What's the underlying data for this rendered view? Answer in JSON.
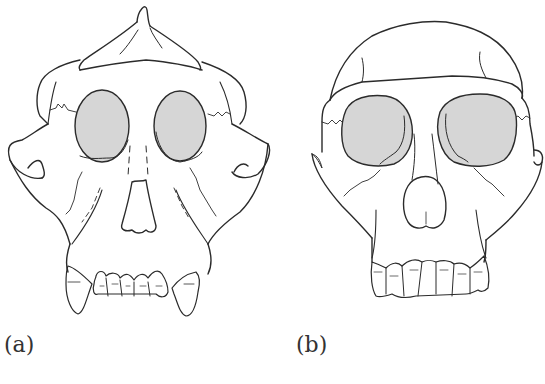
{
  "figure": {
    "panels": [
      {
        "id": "a",
        "label": "(a)",
        "subject": "ape-skull-front-view"
      },
      {
        "id": "b",
        "label": "(b)",
        "subject": "hominin-skull-front-view"
      }
    ],
    "colors": {
      "line": "#2b2b2b",
      "orbit_fill": "#d6d6d6",
      "background": "#ffffff"
    }
  }
}
